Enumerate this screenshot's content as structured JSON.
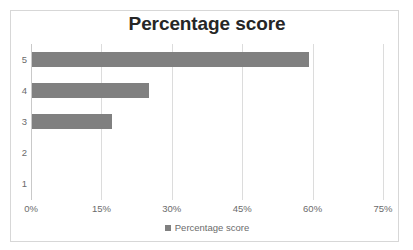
{
  "chart_data": {
    "type": "bar",
    "orientation": "horizontal",
    "title": "Percentage score",
    "xlabel": "",
    "ylabel": "",
    "categories": [
      "5",
      "4",
      "3",
      "2",
      "1"
    ],
    "values": [
      59,
      25,
      17,
      0,
      0
    ],
    "value_labels": [
      "59%",
      "25%",
      "17%",
      "0%",
      "0%"
    ],
    "series": [
      {
        "name": "Percentage score",
        "color": "#808080",
        "values": [
          59,
          25,
          17,
          0,
          0
        ]
      }
    ],
    "xlim": [
      0,
      75
    ],
    "ylim": [
      0,
      5
    ],
    "xticks": [
      0,
      15,
      30,
      45,
      60,
      75
    ],
    "xtick_labels": [
      "0%",
      "15%",
      "30%",
      "45%",
      "60%",
      "75%"
    ],
    "ytick_labels": [
      "5",
      "4",
      "3",
      "2",
      "1"
    ],
    "grid": true,
    "grid_axis": "x",
    "legend": {
      "visible": true,
      "position": "bottom",
      "entries": [
        {
          "label": "Percentage score",
          "marker": "square",
          "color": "#808080"
        }
      ]
    },
    "colors": {
      "bar": "#808080",
      "gridline": "#dcdcdc",
      "axis": "#c9c9c9",
      "text": "#6b6b6b",
      "title": "#262626",
      "border": "#d7d7d7",
      "background": "#ffffff"
    }
  }
}
